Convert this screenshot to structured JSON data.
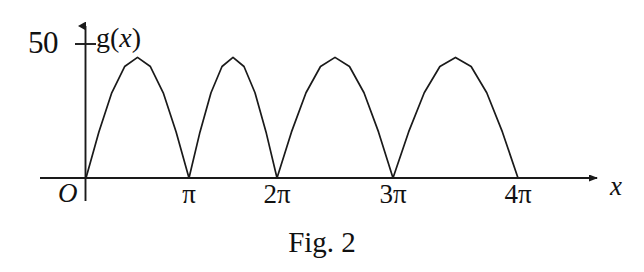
{
  "figure": {
    "caption": "Fig. 2",
    "function_label": "g(",
    "function_label_var": "x",
    "function_label_close": ")",
    "x_axis_name": "x",
    "origin_label": "O",
    "y_tick_label": "50"
  },
  "chart_data": {
    "type": "line",
    "title": "",
    "subtitle": "",
    "xlabel": "x",
    "ylabel": "g(x)",
    "legend": [],
    "legend_position": "none",
    "grid": false,
    "series_color": "#1a1a1a",
    "axis_color": "#1a1a1a",
    "background": "#ffffff",
    "xlim": [
      0,
      13.6
    ],
    "ylim": [
      0,
      57
    ],
    "x_tick_labels": [
      "O",
      "π",
      "2π",
      "3π",
      "4π"
    ],
    "x_tick_values": [
      0,
      3.1416,
      6.2832,
      9.4248,
      12.5664
    ],
    "y_tick_labels": [
      "50"
    ],
    "y_tick_values": [
      50
    ],
    "peaks": [
      {
        "x": 1.5708,
        "y": 45
      },
      {
        "x": 4.7124,
        "y": 45
      },
      {
        "x": 7.854,
        "y": 45
      },
      {
        "x": 10.9956,
        "y": 45
      }
    ],
    "zeros": [
      0,
      3.1416,
      6.2832,
      9.4248,
      12.5664
    ],
    "series": [
      {
        "name": "g(x)",
        "x": [
          0,
          0.3927,
          0.7854,
          1.1781,
          1.5708,
          1.9635,
          2.3562,
          2.7489,
          3.1416,
          3.5343,
          3.927,
          4.3197,
          4.7124,
          5.1051,
          5.4978,
          5.8905,
          6.2832,
          6.6759,
          7.0686,
          7.4613,
          7.854,
          8.2467,
          8.6394,
          9.0321,
          9.4248,
          9.8175,
          10.2102,
          10.6029,
          10.9956,
          11.3883,
          11.781,
          12.1737,
          12.5664
        ],
        "values": [
          0,
          17.2,
          31.8,
          41.6,
          45,
          41.6,
          31.8,
          17.2,
          0,
          17.2,
          31.8,
          41.6,
          45,
          41.6,
          31.8,
          17.2,
          0,
          17.2,
          31.8,
          41.6,
          45,
          41.6,
          31.8,
          17.2,
          0,
          17.2,
          31.8,
          41.6,
          45,
          41.6,
          31.8,
          17.2,
          0
        ]
      }
    ]
  },
  "x_ticks": [
    {
      "label": "O",
      "left_px": 70
    },
    {
      "label": "π",
      "left_px": 189
    },
    {
      "label": "2π",
      "left_px": 277
    },
    {
      "label": "3π",
      "left_px": 393
    },
    {
      "label": "4π",
      "left_px": 518
    }
  ]
}
